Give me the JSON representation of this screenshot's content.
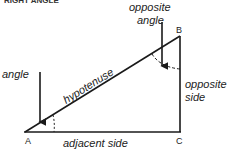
{
  "caption": "RIGHT ANGLE",
  "colors": {
    "line": "#1a1a1a",
    "text": "#222222",
    "background": "#ffffff"
  },
  "vertices": {
    "A": {
      "label": "A",
      "x": 25,
      "y": 132
    },
    "B": {
      "label": "B",
      "x": 180,
      "y": 36
    },
    "C": {
      "label": "C",
      "x": 180,
      "y": 132
    }
  },
  "labels": {
    "angle": "angle",
    "opposite_angle_line1": "opposite",
    "opposite_angle_line2": "angle",
    "hypotenuse": "hypotenuse",
    "opposite_side_line1": "opposite",
    "opposite_side_line2": "side",
    "adjacent_side": "adjacent side"
  }
}
